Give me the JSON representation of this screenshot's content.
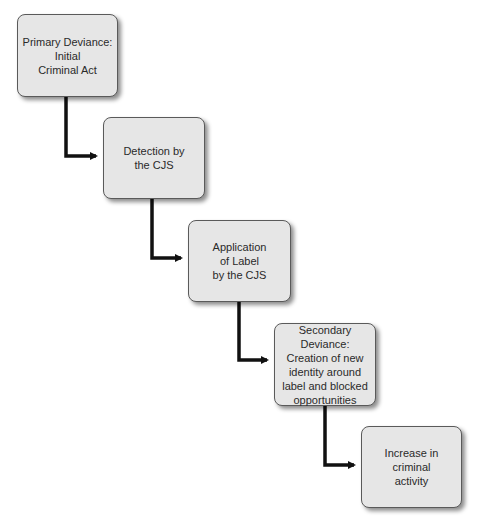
{
  "diagram": {
    "type": "flowchart-staircase",
    "colors": {
      "box_fill": "#e6e6e6",
      "box_border": "#5a5a5a",
      "connector": "#111111",
      "text": "#2a2a2a"
    },
    "nodes": [
      {
        "id": "primary-deviance",
        "label": "Primary Deviance:\nInitial\nCriminal Act",
        "x": 17,
        "y": 14,
        "w": 101,
        "h": 83
      },
      {
        "id": "detection",
        "label": "Detection by\nthe CJS",
        "x": 103,
        "y": 117,
        "w": 102,
        "h": 82
      },
      {
        "id": "application-of-label",
        "label": "Application\nof Label\nby the CJS",
        "x": 188,
        "y": 220,
        "w": 103,
        "h": 82
      },
      {
        "id": "secondary-deviance",
        "label": "Secondary Deviance:\nCreation of new\nidentity around\nlabel and blocked\nopportunities",
        "x": 274,
        "y": 323,
        "w": 102,
        "h": 83
      },
      {
        "id": "increase-in-criminal-activity",
        "label": "Increase in\ncriminal\nactivity",
        "x": 361,
        "y": 426,
        "w": 101,
        "h": 82
      }
    ],
    "edges": [
      {
        "from": "primary-deviance",
        "to": "detection",
        "vx": 66,
        "y1": 97,
        "y2": 156,
        "x2": 102
      },
      {
        "from": "detection",
        "to": "application-of-label",
        "vx": 152,
        "y1": 199,
        "y2": 258,
        "x2": 187
      },
      {
        "from": "application-of-label",
        "to": "secondary-deviance",
        "vx": 239,
        "y1": 302,
        "y2": 360,
        "x2": 273
      },
      {
        "from": "secondary-deviance",
        "to": "increase-in-criminal-activity",
        "vx": 325,
        "y1": 406,
        "y2": 465,
        "x2": 360
      }
    ]
  }
}
